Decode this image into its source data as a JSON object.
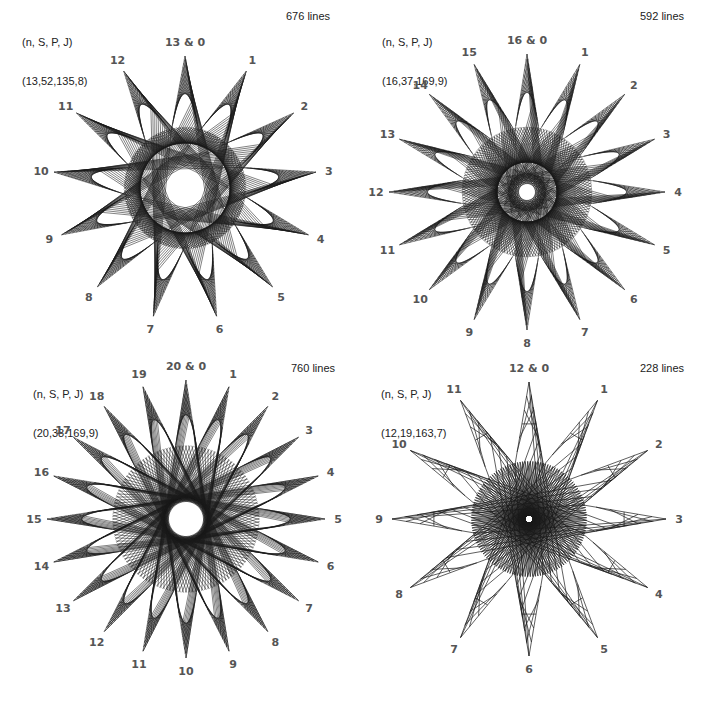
{
  "figure": {
    "panels": [
      {
        "id": "p1",
        "param_header": "(n, S, P, J)",
        "param_values": "(13,52,135,8)",
        "n": 13,
        "S": 52,
        "P": 135,
        "J": 8,
        "line_count_label": "676 lines",
        "top_label": "13 & 0",
        "vertex_labels": [
          "13 & 0",
          "1",
          "2",
          "3",
          "4",
          "5",
          "6",
          "7",
          "8",
          "9",
          "10",
          "11",
          "12"
        ],
        "center": [
          185,
          188
        ],
        "outer_radius": 132,
        "inner_radius": 58,
        "hole_radius": 45
      },
      {
        "id": "p2",
        "param_header": "(n, S, P, J)",
        "param_values": "(16,37,169,9)",
        "n": 16,
        "S": 37,
        "P": 169,
        "J": 9,
        "line_count_label": "592 lines",
        "top_label": "16 & 0",
        "vertex_labels": [
          "16 & 0",
          "1",
          "2",
          "3",
          "4",
          "5",
          "6",
          "7",
          "8",
          "9",
          "10",
          "11",
          "12",
          "13",
          "14",
          "15"
        ],
        "center": [
          170,
          192
        ],
        "outer_radius": 138,
        "inner_radius": 62,
        "hole_radius": 30
      },
      {
        "id": "p3",
        "param_header": "(n, S, P, J)",
        "param_values": "(20,38,169,9)",
        "n": 20,
        "S": 38,
        "P": 169,
        "J": 9,
        "line_count_label": "760 lines",
        "top_label": "20 & 0",
        "vertex_labels": [
          "20 & 0",
          "1",
          "2",
          "3",
          "4",
          "5",
          "6",
          "7",
          "8",
          "9",
          "10",
          "11",
          "12",
          "13",
          "14",
          "15",
          "16",
          "17",
          "18",
          "19"
        ],
        "center": [
          186,
          163
        ],
        "outer_radius": 139,
        "inner_radius": 70,
        "hole_radius": 22
      },
      {
        "id": "p4",
        "param_header": "(n, S, P, J)",
        "param_values": "(12,19,163,7)",
        "n": 12,
        "S": 19,
        "P": 163,
        "J": 7,
        "line_count_label": "228 lines",
        "top_label": "12 & 0",
        "vertex_labels": [
          "12 & 0",
          "1",
          "2",
          "3",
          "4",
          "5",
          "6",
          "7",
          "8",
          "9",
          "10",
          "11"
        ],
        "center": [
          172,
          163
        ],
        "outer_radius": 137,
        "inner_radius": 55,
        "hole_radius": 4
      }
    ],
    "line_color": "#1a1a1a",
    "label_color": "#555555"
  }
}
